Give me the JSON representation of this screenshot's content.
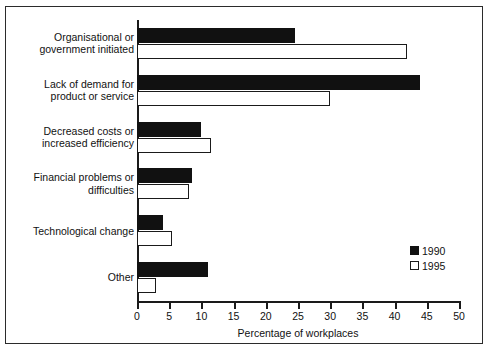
{
  "chart_data": {
    "type": "bar",
    "orientation": "horizontal",
    "title": "",
    "xlabel": "Percentage of workplaces",
    "ylabel": "",
    "xlim": [
      0,
      50
    ],
    "xticks": [
      0,
      5,
      10,
      15,
      20,
      25,
      30,
      35,
      40,
      45,
      50
    ],
    "grid": false,
    "legend_position": "inside-lower-right",
    "categories": [
      "Organisational or\ngovernment initiated",
      "Lack of demand for\nproduct or service",
      "Decreased costs or\nincreased efficiency",
      "Financial problems or\ndifficulties",
      "Technological change",
      "Other"
    ],
    "series": [
      {
        "name": "1990",
        "color": "#111111",
        "style": "filled",
        "values": [
          24.5,
          44,
          10,
          8.5,
          4,
          11
        ]
      },
      {
        "name": "1995",
        "color": "#ffffff",
        "style": "outlined",
        "values": [
          42,
          30,
          11.5,
          8,
          5.5,
          3
        ]
      }
    ]
  }
}
